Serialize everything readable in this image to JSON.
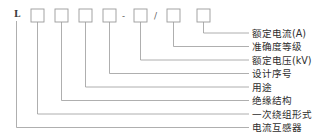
{
  "diagram": {
    "prefix_char": "L",
    "separators": {
      "dash": "-",
      "slash": "/"
    },
    "box_count": 7,
    "boxes": [
      {
        "index": 1,
        "value": ""
      },
      {
        "index": 2,
        "value": ""
      },
      {
        "index": 3,
        "value": ""
      },
      {
        "index": 4,
        "value": ""
      },
      {
        "index": 5,
        "value": ""
      },
      {
        "index": 6,
        "value": ""
      },
      {
        "index": 7,
        "value": ""
      }
    ],
    "labels": [
      {
        "index": 1,
        "text": "额定电流(A)"
      },
      {
        "index": 2,
        "text": "准确度等级"
      },
      {
        "index": 3,
        "text": "额定电压(kV)"
      },
      {
        "index": 4,
        "text": "设计序号"
      },
      {
        "index": 5,
        "text": "用途"
      },
      {
        "index": 6,
        "text": "绝缘结构"
      },
      {
        "index": 7,
        "text": "一次绕组形式"
      },
      {
        "index": 8,
        "text": "电流互感器"
      }
    ],
    "colors": {
      "background": "#ffffff",
      "line": "#9a9a9a",
      "text": "#2e2e2e",
      "code": "#3a3a3a"
    }
  }
}
